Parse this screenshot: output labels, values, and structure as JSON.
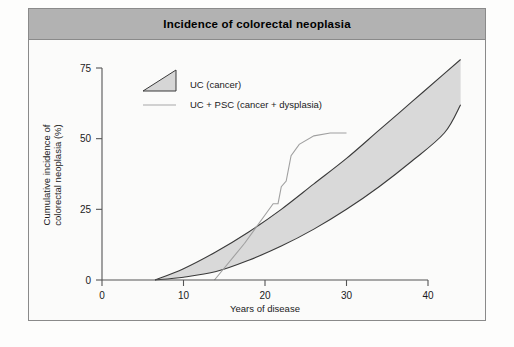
{
  "figure": {
    "title": "Incidence of colorectal neoplasia"
  },
  "legend": [
    {
      "label": "UC (cancer)",
      "marker": "filled-triangle-swatch",
      "color": "#d6d6d6"
    },
    {
      "label": "UC + PSC (cancer + dysplasia)",
      "marker": "line-swatch",
      "color": "#a8a8a8"
    }
  ],
  "colors": {
    "title_bar": "#b2b2b2",
    "band_fill": "#d9d9d9",
    "band_stroke": "#3a3a3a",
    "psc_line": "#a0a0a0",
    "axis": "#555555",
    "frame_border": "#8a8a8a",
    "page_background": "#fdfdfc"
  },
  "chart_data": {
    "type": "area",
    "title": "Incidence of colorectal neoplasia",
    "xlabel": "Years of disease",
    "ylabel": "Cumulative incidence of colorectal neoplasia (%)",
    "xlim": [
      0,
      44
    ],
    "ylim": [
      0,
      78
    ],
    "xticks": [
      0,
      10,
      20,
      30,
      40
    ],
    "yticks": [
      0,
      25,
      50,
      75
    ],
    "xtick_labels": [
      "0",
      "10",
      "20",
      "30",
      "40"
    ],
    "ytick_labels": [
      "0",
      "25",
      "50",
      "75"
    ],
    "grid": false,
    "legend_position": "top-left-inside",
    "series": [
      {
        "name": "UC (cancer)",
        "type": "band",
        "x": [
          6.5,
          10,
          14,
          18,
          22,
          26,
          30,
          34,
          38,
          42,
          44
        ],
        "upper": [
          0,
          4,
          10,
          17,
          25,
          34,
          43,
          53,
          63,
          73,
          78
        ],
        "lower": [
          0,
          1,
          3,
          7,
          12,
          18,
          25,
          33,
          42,
          52,
          62
        ]
      },
      {
        "name": "UC + PSC (cancer + dysplasia)",
        "type": "step-line",
        "x": [
          13.8,
          17.5,
          20.0,
          21.0,
          21.6,
          22.0,
          22.6,
          23.2,
          24.2,
          26.0,
          28.0,
          30.0
        ],
        "y": [
          0,
          13,
          23,
          27,
          27,
          33,
          35,
          44,
          48,
          51,
          52,
          52
        ]
      }
    ]
  }
}
